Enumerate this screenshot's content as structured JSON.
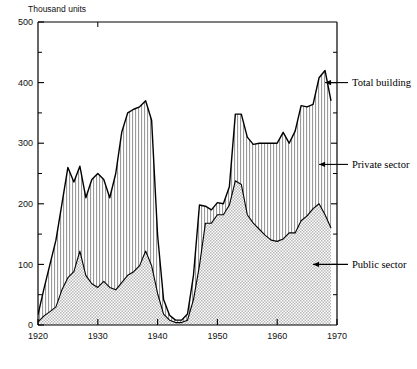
{
  "chart_data": {
    "type": "area",
    "title": "",
    "subtitle": "",
    "xlabel": "",
    "ylabel": "Thousand units",
    "xlim": [
      1920,
      1970
    ],
    "ylim": [
      0,
      500
    ],
    "grid": false,
    "stacked": true,
    "legend_position": "right-annotations",
    "x_ticks": [
      1920,
      1930,
      1940,
      1950,
      1960,
      1970
    ],
    "x_tick_labels": [
      "1920",
      "1930",
      "1940",
      "1950",
      "1960",
      "1970"
    ],
    "x_minor_ticks": [
      1925,
      1935,
      1945,
      1955,
      1965
    ],
    "y_ticks": [
      0,
      100,
      200,
      300,
      400,
      500
    ],
    "y_tick_labels": [
      "0",
      "100",
      "200",
      "300",
      "400",
      "500"
    ],
    "y_minor_ticks": [
      50,
      150,
      250,
      350,
      450
    ],
    "x": [
      1920,
      1921,
      1922,
      1923,
      1924,
      1925,
      1926,
      1927,
      1928,
      1929,
      1930,
      1931,
      1932,
      1933,
      1934,
      1935,
      1936,
      1937,
      1938,
      1939,
      1940,
      1941,
      1942,
      1943,
      1944,
      1945,
      1946,
      1947,
      1948,
      1949,
      1950,
      1951,
      1952,
      1953,
      1954,
      1955,
      1956,
      1957,
      1958,
      1959,
      1960,
      1961,
      1962,
      1963,
      1964,
      1965,
      1966,
      1967,
      1968,
      1969
    ],
    "series": [
      {
        "name": "Public sector",
        "fill_pattern": "dots",
        "values": [
          5,
          15,
          22,
          30,
          58,
          78,
          88,
          122,
          82,
          68,
          62,
          72,
          62,
          58,
          70,
          82,
          88,
          98,
          122,
          98,
          52,
          18,
          8,
          4,
          4,
          8,
          42,
          98,
          168,
          168,
          182,
          182,
          198,
          238,
          232,
          182,
          168,
          158,
          148,
          140,
          138,
          142,
          152,
          152,
          172,
          180,
          192,
          200,
          182,
          160
        ]
      },
      {
        "name": "Private sector",
        "fill_pattern": "vertical-lines",
        "values": [
          12,
          45,
          78,
          110,
          142,
          182,
          148,
          140,
          128,
          172,
          188,
          168,
          148,
          192,
          248,
          268,
          268,
          262,
          248,
          240,
          96,
          24,
          8,
          4,
          4,
          10,
          40,
          100,
          28,
          22,
          20,
          18,
          30,
          110,
          116,
          128,
          130,
          142,
          152,
          160,
          162,
          176,
          148,
          168,
          190,
          180,
          172,
          208,
          238,
          210
        ]
      }
    ],
    "total_series": {
      "name": "Total building",
      "values": [
        17,
        60,
        100,
        140,
        200,
        260,
        236,
        262,
        210,
        240,
        250,
        240,
        210,
        250,
        318,
        350,
        356,
        360,
        370,
        338,
        148,
        42,
        16,
        8,
        8,
        18,
        82,
        198,
        196,
        190,
        202,
        200,
        228,
        348,
        348,
        310,
        298,
        300,
        300,
        300,
        300,
        318,
        300,
        320,
        362,
        360,
        364,
        408,
        420,
        370
      ]
    },
    "annotations": [
      {
        "id": "total-building",
        "label": "Total building",
        "target_year": 1968,
        "target_value": 400
      },
      {
        "id": "private-sector",
        "label": "Private sector",
        "target_year": 1967,
        "target_value": 265
      },
      {
        "id": "public-sector",
        "label": "Public sector",
        "target_year": 1966,
        "target_value": 100
      }
    ]
  },
  "axis": {
    "y_unit_label": "Thousand units"
  },
  "caption": {
    "text": ""
  }
}
